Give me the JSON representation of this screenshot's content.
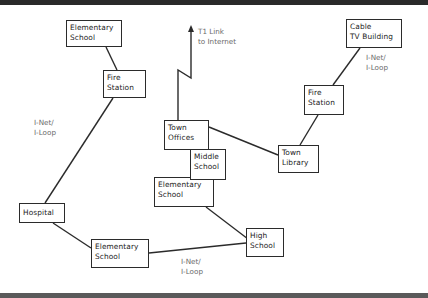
{
  "diagram": {
    "title": "",
    "nodes": [
      {
        "id": "elem-top",
        "lines": [
          "Elementary",
          "School"
        ],
        "x": 66,
        "y": 20,
        "w": 56,
        "h": 27
      },
      {
        "id": "fire-left",
        "lines": [
          "Fire",
          "Station"
        ],
        "x": 103,
        "y": 70,
        "w": 43,
        "h": 28
      },
      {
        "id": "hospital",
        "lines": [
          "Hospital"
        ],
        "x": 19,
        "y": 203,
        "w": 46,
        "h": 20
      },
      {
        "id": "elem-bottom",
        "lines": [
          "Elementary",
          "School"
        ],
        "x": 91,
        "y": 239,
        "w": 58,
        "h": 29
      },
      {
        "id": "high-school",
        "lines": [
          "High",
          "School"
        ],
        "x": 246,
        "y": 228,
        "w": 38,
        "h": 29
      },
      {
        "id": "elem-center",
        "lines": [
          "Elementary",
          "School"
        ],
        "x": 154,
        "y": 177,
        "w": 60,
        "h": 30
      },
      {
        "id": "middle-school",
        "lines": [
          "Middle",
          "School"
        ],
        "x": 190,
        "y": 149,
        "w": 36,
        "h": 31
      },
      {
        "id": "town-offices",
        "lines": [
          "Town",
          "Offices"
        ],
        "x": 164,
        "y": 120,
        "w": 45,
        "h": 30
      },
      {
        "id": "town-library",
        "lines": [
          "Town",
          "Library"
        ],
        "x": 278,
        "y": 145,
        "w": 41,
        "h": 28
      },
      {
        "id": "fire-right",
        "lines": [
          "Fire",
          "Station"
        ],
        "x": 304,
        "y": 85,
        "w": 40,
        "h": 30
      },
      {
        "id": "cable-tv",
        "lines": [
          "Cable",
          "TV Building"
        ],
        "x": 346,
        "y": 19,
        "w": 56,
        "h": 29
      }
    ],
    "labels": [
      {
        "id": "inet-left",
        "lines": [
          "I-Net/",
          "I-Loop"
        ],
        "x": 34,
        "y": 118
      },
      {
        "id": "inet-bottom",
        "lines": [
          "I-Net/",
          "I-Loop"
        ],
        "x": 181,
        "y": 257
      },
      {
        "id": "inet-right",
        "lines": [
          "I-Net/",
          "I-Loop"
        ],
        "x": 366,
        "y": 53
      },
      {
        "id": "t1-link",
        "lines": [
          "T1 Link",
          "to Internet"
        ],
        "x": 198,
        "y": 27
      }
    ],
    "edges": [
      {
        "from": "elem-top",
        "to": "fire-left",
        "points": [
          [
            106,
            47
          ],
          [
            117,
            70
          ]
        ]
      },
      {
        "from": "fire-left",
        "to": "hospital",
        "points": [
          [
            113,
            98
          ],
          [
            45,
            203
          ]
        ]
      },
      {
        "from": "hospital",
        "to": "elem-bottom",
        "points": [
          [
            53,
            223
          ],
          [
            91,
            248
          ]
        ]
      },
      {
        "from": "elem-bottom",
        "to": "high-school",
        "points": [
          [
            149,
            253
          ],
          [
            246,
            243
          ]
        ]
      },
      {
        "from": "elem-center",
        "to": "high-school",
        "points": [
          [
            206,
            207
          ],
          [
            248,
            239
          ]
        ]
      },
      {
        "from": "town-offices",
        "to": "town-library",
        "points": [
          [
            209,
            127
          ],
          [
            278,
            155
          ]
        ]
      },
      {
        "from": "town-library",
        "to": "fire-right",
        "points": [
          [
            300,
            145
          ],
          [
            318,
            115
          ]
        ]
      },
      {
        "from": "fire-right",
        "to": "cable-tv",
        "points": [
          [
            333,
            85
          ],
          [
            360,
            48
          ]
        ]
      }
    ],
    "t1_line": {
      "points": [
        [
          178,
          120
        ],
        [
          178,
          70
        ],
        [
          191,
          78
        ],
        [
          191,
          30
        ]
      ],
      "arrow_tip": [
        191,
        27
      ]
    },
    "colors": {
      "line": "#2b2b2b",
      "border": "#2b2b2b",
      "label": "#6a6a6a",
      "text": "#222222"
    }
  }
}
